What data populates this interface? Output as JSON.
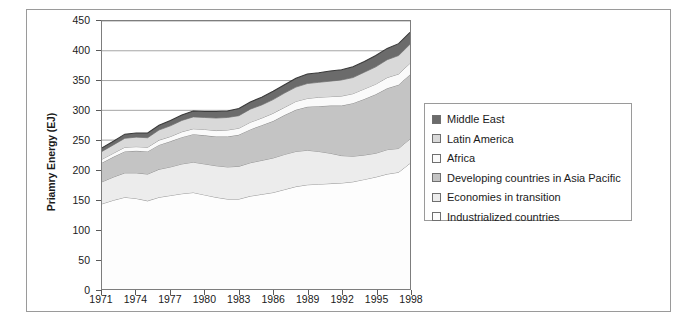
{
  "chart_data": {
    "type": "area",
    "stacked": true,
    "title": "",
    "xlabel": "",
    "ylabel": "Priamry Energy (EJ)",
    "ylim": [
      0,
      450
    ],
    "ytick_step": 50,
    "yticks": [
      0,
      50,
      100,
      150,
      200,
      250,
      300,
      350,
      400,
      450
    ],
    "xlim": [
      1971,
      1998
    ],
    "xticks": [
      1971,
      1974,
      1977,
      1980,
      1983,
      1986,
      1989,
      1992,
      1995,
      1998
    ],
    "grid": "horizontal",
    "legend_position": "right",
    "x": [
      1971,
      1972,
      1973,
      1974,
      1975,
      1976,
      1977,
      1978,
      1979,
      1980,
      1981,
      1982,
      1983,
      1984,
      1985,
      1986,
      1987,
      1988,
      1989,
      1990,
      1991,
      1992,
      1993,
      1994,
      1995,
      1996,
      1997,
      1998
    ],
    "series": [
      {
        "name": "Industrialized countries",
        "color": "#fdfdfd",
        "values": [
          143,
          149,
          154,
          152,
          148,
          154,
          157,
          160,
          162,
          158,
          154,
          151,
          151,
          156,
          159,
          162,
          167,
          172,
          175,
          176,
          177,
          178,
          180,
          184,
          188,
          193,
          196,
          211
        ]
      },
      {
        "name": "Economies in transition",
        "color": "#ececec",
        "values": [
          37,
          39,
          41,
          43,
          45,
          47,
          48,
          50,
          51,
          52,
          53,
          54,
          55,
          56,
          57,
          58,
          59,
          59,
          58,
          55,
          51,
          46,
          43,
          41,
          40,
          41,
          40,
          41
        ]
      },
      {
        "name": "Developing countries in Asia Pacific",
        "color": "#c4c4c4",
        "values": [
          32,
          34,
          36,
          37,
          38,
          41,
          43,
          45,
          47,
          48,
          49,
          51,
          53,
          56,
          59,
          62,
          66,
          70,
          73,
          76,
          80,
          84,
          89,
          94,
          99,
          103,
          107,
          108
        ]
      },
      {
        "name": "Africa",
        "color": "#fafafa",
        "values": [
          6,
          6,
          7,
          7,
          7,
          8,
          8,
          9,
          9,
          10,
          10,
          11,
          11,
          12,
          12,
          13,
          13,
          14,
          14,
          15,
          15,
          16,
          16,
          17,
          17,
          18,
          18,
          19
        ]
      },
      {
        "name": "Latin America",
        "color": "#d9d9d9",
        "values": [
          13,
          14,
          15,
          16,
          16,
          17,
          18,
          19,
          20,
          20,
          21,
          21,
          21,
          22,
          22,
          23,
          24,
          24,
          25,
          25,
          26,
          27,
          27,
          28,
          29,
          30,
          31,
          32
        ]
      },
      {
        "name": "Middle East",
        "color": "#6b6b6b",
        "values": [
          6,
          6,
          7,
          7,
          8,
          8,
          9,
          9,
          10,
          10,
          11,
          11,
          12,
          12,
          13,
          14,
          14,
          15,
          16,
          16,
          17,
          17,
          18,
          18,
          19,
          19,
          20,
          20
        ]
      }
    ],
    "totals": [
      237,
      248,
      260,
      262,
      262,
      275,
      283,
      292,
      299,
      298,
      298,
      299,
      303,
      314,
      322,
      332,
      343,
      354,
      361,
      363,
      366,
      368,
      373,
      382,
      392,
      404,
      412,
      431
    ]
  },
  "legend": {
    "items": [
      {
        "label": "Middle East",
        "swatch": "#6b6b6b"
      },
      {
        "label": "Latin America",
        "swatch": "#d9d9d9"
      },
      {
        "label": "Africa",
        "swatch": "#fafafa"
      },
      {
        "label": "Developing countries in Asia Pacific",
        "swatch": "#c4c4c4"
      },
      {
        "label": "Economies in transition",
        "swatch": "#ececec"
      },
      {
        "label": "Industrialized countries",
        "swatch": "#fdfdfd"
      }
    ]
  },
  "axis": {
    "y_title": "Priamry Energy (EJ)",
    "y_labels": [
      "450",
      "400",
      "350",
      "300",
      "250",
      "200",
      "150",
      "100",
      "50",
      "0"
    ],
    "x_labels": [
      "1971",
      "1974",
      "1977",
      "1980",
      "1983",
      "1986",
      "1989",
      "1992",
      "1995",
      "1998"
    ]
  },
  "caption": {
    "text": ""
  }
}
